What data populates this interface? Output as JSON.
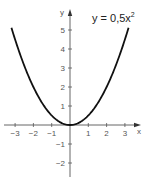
{
  "chart_data": {
    "type": "line",
    "equation": {
      "text": "y = 0,5x",
      "superscript": "2"
    },
    "xlabel": "x",
    "ylabel": "y",
    "xlim": [
      -3.2,
      3.2
    ],
    "ylim": [
      -2.5,
      5.5
    ],
    "x_ticks": [
      -3,
      -2,
      -1,
      1,
      2,
      3
    ],
    "x_tick_labels": [
      "−3",
      "−2",
      "−1",
      "1",
      "2",
      "3"
    ],
    "y_ticks": [
      -2,
      -1,
      1,
      2,
      3,
      4,
      5
    ],
    "y_tick_labels": [
      "−2",
      "−1",
      "1",
      "2",
      "3",
      "4",
      "5"
    ],
    "grid": false,
    "series": [
      {
        "name": "y = 0,5x²",
        "x": [
          -3.2,
          -3,
          -2.5,
          -2,
          -1.5,
          -1,
          -0.5,
          0,
          0.5,
          1,
          1.5,
          2,
          2.5,
          3,
          3.2
        ],
        "y": [
          5.12,
          4.5,
          3.125,
          2,
          1.125,
          0.5,
          0.125,
          0,
          0.125,
          0.5,
          1.125,
          2,
          3.125,
          4.5,
          5.12
        ],
        "color": "#111111"
      }
    ]
  }
}
